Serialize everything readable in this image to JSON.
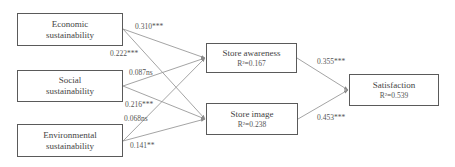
{
  "diagram": {
    "type": "path-model",
    "nodes": {
      "economic": {
        "line1": "Economic",
        "line2": "sustainability"
      },
      "social": {
        "line1": "Social",
        "line2": "sustainability"
      },
      "environmental": {
        "line1": "Environmental",
        "line2": "sustainability"
      },
      "awareness": {
        "title": "Store awareness",
        "r2": "R²=0.167"
      },
      "image": {
        "title": "Store image",
        "r2": "R²=0.238"
      },
      "satisfaction": {
        "title": "Satisfaction",
        "r2": "R²=0.539"
      }
    },
    "edges": [
      {
        "from": "Economic sustainability",
        "to": "Store awareness",
        "label": "0.310***"
      },
      {
        "from": "Economic sustainability",
        "to": "Store image",
        "label": "0.222***"
      },
      {
        "from": "Social sustainability",
        "to": "Store awareness",
        "label": "0.087ns"
      },
      {
        "from": "Social sustainability",
        "to": "Store image",
        "label": "0.216***"
      },
      {
        "from": "Environmental sustainability",
        "to": "Store awareness",
        "label": "0.068ns"
      },
      {
        "from": "Environmental sustainability",
        "to": "Store image",
        "label": "0.141**"
      },
      {
        "from": "Store awareness",
        "to": "Satisfaction",
        "label": "0.355***"
      },
      {
        "from": "Store image",
        "to": "Satisfaction",
        "label": "0.453***"
      }
    ],
    "colors": {
      "box_border": "#5a5a5a",
      "edge": "#9a9a9a",
      "text": "#444444"
    }
  }
}
